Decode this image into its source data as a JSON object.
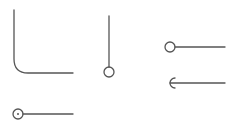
{
  "diagram": {
    "background": "#ffffff",
    "stroke_color": "#555555",
    "stroke_width": 1.3,
    "symbols": [
      {
        "name": "elbow-connector",
        "type": "elbow",
        "start": [
          14,
          10
        ],
        "corner_radius": 14,
        "corner": [
          14,
          73
        ],
        "end": [
          73,
          73
        ]
      },
      {
        "name": "vertical-pin-connector",
        "type": "line-with-circle",
        "start": [
          109,
          16
        ],
        "end": [
          109,
          67
        ],
        "circle_center": [
          109,
          72
        ],
        "circle_radius": 5
      },
      {
        "name": "ball-connector",
        "type": "line-with-circle",
        "start": [
          175,
          47
        ],
        "end": [
          225,
          47
        ],
        "circle_center": [
          170,
          47
        ],
        "circle_radius": 5
      },
      {
        "name": "socket-connector",
        "type": "line-with-socket",
        "start": [
          169,
          83
        ],
        "end": [
          225,
          83
        ],
        "socket_center": [
          174,
          83
        ],
        "socket_radius": 5
      },
      {
        "name": "ball-dot-connector",
        "type": "line-with-dotted-circle",
        "start": [
          23,
          114
        ],
        "end": [
          73,
          114
        ],
        "circle_center": [
          18,
          114
        ],
        "circle_radius": 5,
        "dot_radius": 1
      }
    ]
  }
}
